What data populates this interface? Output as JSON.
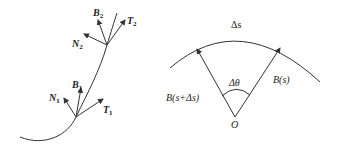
{
  "figure_left": {
    "title": "Frenet frame along a space curve",
    "points": [
      {
        "id": "1",
        "labels": {
          "T": "T",
          "B": "B",
          "N": "N",
          "sub": "1"
        }
      },
      {
        "id": "2",
        "labels": {
          "T": "T",
          "B": "B",
          "N": "N",
          "sub": "2"
        }
      }
    ]
  },
  "figure_right": {
    "arc_label": "Δs",
    "angle_label": "Δθ",
    "origin_label": "O",
    "vector_right_label": "B(s)",
    "vector_left_label": "B(s+Δs)"
  },
  "colors": {
    "stroke": "#333333",
    "background": "#ffffff"
  }
}
